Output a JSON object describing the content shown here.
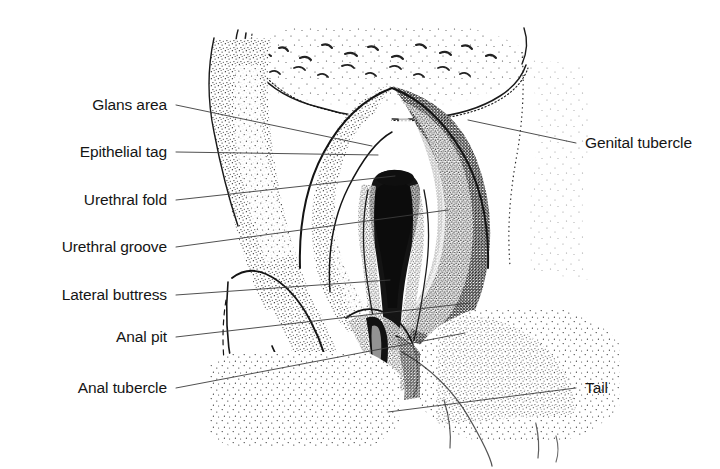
{
  "figure": {
    "background_color": "#ffffff",
    "ink_color": "#1a1a1a",
    "text_color": "#151515",
    "cropped_caption_fragment": "Stage 18"
  },
  "labels_left": [
    {
      "id": "glans-area",
      "text": "Glans area",
      "x": 167,
      "y": 105,
      "leader_to_x": 372,
      "leader_to_y": 146
    },
    {
      "id": "epithelial-tag",
      "text": "Epithelial tag",
      "x": 167,
      "y": 152,
      "leader_to_x": 378,
      "leader_to_y": 155
    },
    {
      "id": "urethral-fold",
      "text": "Urethral fold",
      "x": 167,
      "y": 200,
      "leader_to_x": 395,
      "leader_to_y": 176
    },
    {
      "id": "urethral-groove",
      "text": "Urethral groove",
      "x": 167,
      "y": 247,
      "leader_to_x": 448,
      "leader_to_y": 210
    },
    {
      "id": "lateral-buttress",
      "text": "Lateral buttress",
      "x": 167,
      "y": 295,
      "leader_to_x": 390,
      "leader_to_y": 280
    },
    {
      "id": "anal-pit",
      "text": "Anal pit",
      "x": 167,
      "y": 337,
      "leader_to_x": 470,
      "leader_to_y": 303
    },
    {
      "id": "anal-tubercle",
      "text": "Anal tubercle",
      "x": 167,
      "y": 388,
      "leader_to_x": 465,
      "leader_to_y": 333
    }
  ],
  "labels_right": [
    {
      "id": "genital-tubercle",
      "text": "Genital tubercle",
      "x": 585,
      "y": 143,
      "leader_to_x": 468,
      "leader_to_y": 120
    },
    {
      "id": "tail",
      "text": "Tail",
      "x": 585,
      "y": 388,
      "leader_to_x": 388,
      "leader_to_y": 412
    }
  ],
  "structures": [
    {
      "name": "genital-tubercle-mound",
      "description": "large central dome-shaped tubercle with dense stipple shading on right flank"
    },
    {
      "name": "glans-area",
      "description": "pale unstippled crescent at the apex of the tubercle"
    },
    {
      "name": "urethral-groove",
      "description": "dark tapering midline groove running inferiorly"
    },
    {
      "name": "urethral-folds",
      "description": "paired folds flanking the urethral groove"
    },
    {
      "name": "lateral-buttress",
      "description": "curved ridge lateral to the urethral folds on the left"
    },
    {
      "name": "anal-pit",
      "description": "small depression inferior to the genital tubercle"
    },
    {
      "name": "anal-tubercle",
      "description": "rounded eminence surrounding the anal pit"
    },
    {
      "name": "tail",
      "description": "stippled tail mass at lower right"
    },
    {
      "name": "umbilical-cord-base",
      "description": "stippled band across the top of the field"
    }
  ],
  "leader_line": {
    "color": "#3c3c3c",
    "width": 0.9
  }
}
